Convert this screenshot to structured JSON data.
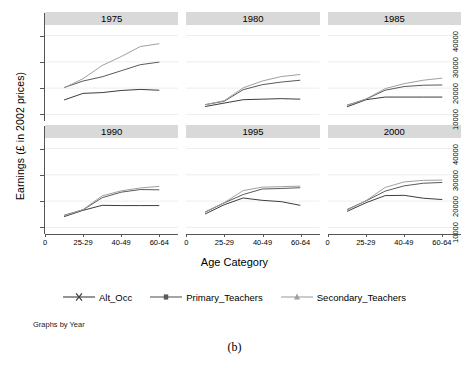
{
  "figure": {
    "ylabel": "Earnings (£ in 2002 prices)",
    "xlabel": "Age Category",
    "note": "Graphs by Year",
    "caption": "(b)"
  },
  "legend": {
    "items": [
      {
        "label": "Alt_Occ",
        "marker": "x-marker-icon",
        "color": "#404040"
      },
      {
        "label": "Primary_Teachers",
        "marker": "square-marker-icon",
        "color": "#595959"
      },
      {
        "label": "Secondary_Teachers",
        "marker": "triangle-marker-icon",
        "color": "#9a9a9a"
      }
    ]
  },
  "yticks": [
    "10000",
    "20000",
    "30000",
    "40000"
  ],
  "xticks": [
    "0",
    "25-29",
    "40-49",
    "60-64"
  ],
  "panels": [
    {
      "title": "1975"
    },
    {
      "title": "1980"
    },
    {
      "title": "1985"
    },
    {
      "title": "1990"
    },
    {
      "title": "1995"
    },
    {
      "title": "2000"
    }
  ],
  "chart_data": {
    "type": "line",
    "title": "",
    "xlabel": "Age Category",
    "ylabel": "Earnings (£ in 2002 prices)",
    "ylim": [
      7500,
      44000
    ],
    "ytick_values": [
      10000,
      20000,
      30000,
      40000
    ],
    "grid": true,
    "legend_position": "bottom",
    "facet_by": "Year",
    "facet_note": "Graphs by Year",
    "x_positions": [
      1,
      2,
      3,
      4,
      5,
      6,
      7
    ],
    "x_tick_positions": [
      0,
      2,
      4,
      6
    ],
    "x_tick_labels": [
      "0",
      "25-29",
      "40-49",
      "60-64"
    ],
    "series_names": [
      "Alt_Occ",
      "Primary_Teachers",
      "Secondary_Teachers"
    ],
    "panels": [
      {
        "title": "1975",
        "series": [
          {
            "name": "Alt_Occ",
            "values": [
              15500,
              18000,
              18300,
              19100,
              19500,
              19200
            ]
          },
          {
            "name": "Primary_Teachers",
            "values": [
              20200,
              22700,
              24300,
              26600,
              28900,
              29900
            ]
          },
          {
            "name": "Secondary_Teachers",
            "values": [
              20100,
              23600,
              28600,
              32000,
              35800,
              36900
            ]
          }
        ]
      },
      {
        "title": "1980",
        "series": [
          {
            "name": "Alt_Occ",
            "values": [
              13000,
              14300,
              15600,
              15800,
              16000,
              15800
            ]
          },
          {
            "name": "Primary_Teachers",
            "values": [
              13700,
              15000,
              19400,
              21300,
              22300,
              23000
            ]
          },
          {
            "name": "Secondary_Teachers",
            "values": [
              13700,
              15200,
              20100,
              22700,
              24400,
              25200
            ]
          }
        ]
      },
      {
        "title": "1985",
        "series": [
          {
            "name": "Alt_Occ",
            "values": [
              12900,
              15600,
              16600,
              16600,
              16600,
              16600
            ]
          },
          {
            "name": "Primary_Teachers",
            "values": [
              13500,
              15800,
              19200,
              20600,
              21100,
              21200
            ]
          },
          {
            "name": "Secondary_Teachers",
            "values": [
              13400,
              15900,
              19800,
              21700,
              23000,
              23800
            ]
          }
        ]
      },
      {
        "title": "1990",
        "series": [
          {
            "name": "Alt_Occ",
            "values": [
              14100,
              16500,
              18400,
              18300,
              18300,
              18300
            ]
          },
          {
            "name": "Primary_Teachers",
            "values": [
              14600,
              16700,
              21300,
              23400,
              24400,
              24300
            ]
          },
          {
            "name": "Secondary_Teachers",
            "values": [
              14400,
              16800,
              22000,
              23900,
              25000,
              25600
            ]
          }
        ]
      },
      {
        "title": "1995",
        "series": [
          {
            "name": "Alt_Occ",
            "values": [
              15100,
              18600,
              21200,
              20300,
              19800,
              18400
            ]
          },
          {
            "name": "Primary_Teachers",
            "values": [
              15800,
              19300,
              22500,
              24600,
              24800,
              25100
            ]
          },
          {
            "name": "Secondary_Teachers",
            "values": [
              15900,
              19400,
              24000,
              25300,
              25500,
              25700
            ]
          }
        ]
      },
      {
        "title": "2000",
        "series": [
          {
            "name": "Alt_Occ",
            "values": [
              16100,
              19400,
              22100,
              22200,
              21100,
              20600
            ]
          },
          {
            "name": "Primary_Teachers",
            "values": [
              16800,
              20100,
              23800,
              25800,
              26800,
              27100
            ]
          },
          {
            "name": "Secondary_Teachers",
            "values": [
              16600,
              20200,
              25200,
              27300,
              27900,
              28000
            ]
          }
        ]
      }
    ]
  }
}
